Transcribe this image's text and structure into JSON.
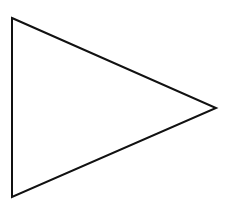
{
  "diagram": {
    "shape": "triangle",
    "orientation": "pointing-right",
    "fill": "none",
    "stroke_color": "#111111",
    "stroke_width": 2,
    "background_color": "#ffffff",
    "vertices": {
      "top_left": [
        12,
        18
      ],
      "right": [
        216,
        108
      ],
      "bottom_left": [
        12,
        197
      ]
    }
  }
}
